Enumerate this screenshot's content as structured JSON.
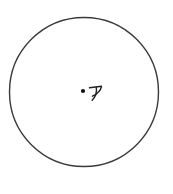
{
  "diagram": {
    "type": "geometry-figure",
    "description": "Circle with a dot marking its center labeled ア",
    "center_label": "ア",
    "colors": {
      "background": "#ffffff",
      "circle_stroke": "#3a3a3a",
      "dot_fill": "#111111",
      "label_color": "#222222"
    }
  }
}
